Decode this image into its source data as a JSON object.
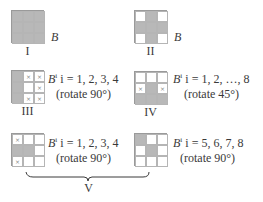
{
  "panels": [
    {
      "id": "I",
      "numeral": "I",
      "label": "B",
      "cells": [
        [
          "g",
          "g",
          "g"
        ],
        [
          "g",
          "g",
          "g"
        ],
        [
          "g",
          "g",
          "g"
        ]
      ]
    },
    {
      "id": "II",
      "numeral": "II",
      "label": "B",
      "cells": [
        [
          "w",
          "g",
          "w"
        ],
        [
          "g",
          "g",
          "g"
        ],
        [
          "w",
          "g",
          "w"
        ]
      ]
    },
    {
      "id": "III",
      "numeral": "III",
      "equation_base": "B",
      "equation_sup": "i",
      "equation_rest": " i = 1, 2, 3, 4",
      "rotation": "(rotate 90°)",
      "cells": [
        [
          "g",
          "x",
          "x"
        ],
        [
          "g",
          "w",
          "x"
        ],
        [
          "g",
          "x",
          "x"
        ]
      ]
    },
    {
      "id": "IV",
      "numeral": "IV",
      "equation_base": "B",
      "equation_sup": "i",
      "equation_rest": " i = 1, 2, …, 8",
      "rotation": "(rotate 45°)",
      "cells": [
        [
          "w",
          "w",
          "w"
        ],
        [
          "x",
          "g",
          "x"
        ],
        [
          "g",
          "g",
          "g"
        ]
      ]
    },
    {
      "id": "V-left",
      "equation_base": "B",
      "equation_sup": "i",
      "equation_rest": " i = 1, 2, 3, 4",
      "rotation": "(rotate 90°)",
      "cells": [
        [
          "x",
          "w",
          "w"
        ],
        [
          "g",
          "g",
          "w"
        ],
        [
          "x",
          "w",
          "w"
        ]
      ]
    },
    {
      "id": "V-right",
      "equation_base": "B",
      "equation_sup": "i",
      "equation_rest": " i = 5, 6, 7, 8",
      "rotation": "(rotate 90°)",
      "cells": [
        [
          "g",
          "w",
          "w"
        ],
        [
          "w",
          "g",
          "w"
        ],
        [
          "w",
          "w",
          "w"
        ]
      ]
    }
  ],
  "group_label": "V",
  "mark_symbol": "×",
  "colors": {
    "shaded": "#b8b8b8",
    "grid_line": "#9a9a9a",
    "text": "#3a3a3a"
  }
}
